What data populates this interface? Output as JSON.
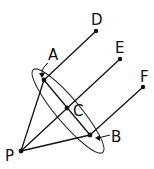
{
  "diagram": {
    "labels": {
      "A": "A",
      "B": "B",
      "C": "C",
      "D": "D",
      "E": "E",
      "F": "F",
      "P": "P"
    },
    "colors": {
      "stroke": "#111111",
      "background": "#ffffff"
    }
  }
}
